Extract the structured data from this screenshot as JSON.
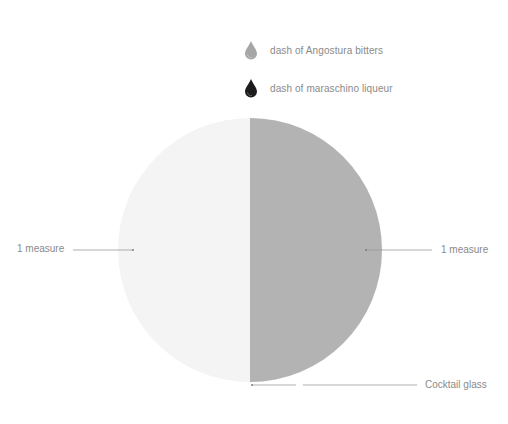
{
  "legend": [
    {
      "label": "dash of Angostura bitters",
      "icon": "drop-icon",
      "color": "#a6a6a6"
    },
    {
      "label": "dash of maraschino liqueur",
      "icon": "drop-icon",
      "color": "#1c1c1c"
    }
  ],
  "glass": {
    "left_label": "1 measure",
    "right_label": "1 measure",
    "bottom_label": "Cocktail glass",
    "left_color": "#f4f4f4",
    "right_color": "#b3b3b3"
  }
}
